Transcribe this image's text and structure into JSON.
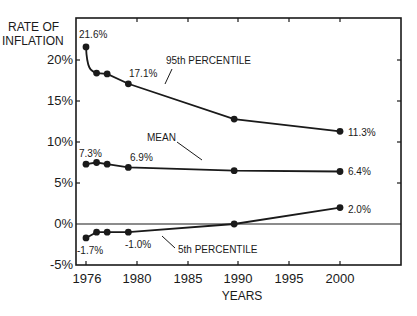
{
  "chart_data": {
    "type": "line",
    "title": "",
    "ylabel": "RATE OF INFLATION",
    "ylabel_lines": [
      "RATE OF",
      "INFLATION"
    ],
    "xlabel": "YEARS",
    "xlim": [
      1975,
      2006
    ],
    "ylim": [
      -5,
      25
    ],
    "x_ticks": [
      1976,
      1980,
      1985,
      1990,
      1995,
      2000
    ],
    "x_tick_labels": [
      "1976",
      "1980",
      "1985",
      "1990",
      "1995",
      "2000"
    ],
    "y_ticks": [
      -5,
      0,
      5,
      10,
      15,
      20
    ],
    "y_tick_labels": [
      "-5%",
      "0%",
      "5%",
      "10%",
      "15%",
      "20%"
    ],
    "grid": false,
    "zero_line": true,
    "series": [
      {
        "name": "95th PERCENTILE",
        "x": [
          1976,
          1977,
          1978,
          1980,
          1990,
          2000
        ],
        "values": [
          21.6,
          18.4,
          18.3,
          17.1,
          12.8,
          11.3
        ]
      },
      {
        "name": "MEAN",
        "x": [
          1976,
          1977,
          1978,
          1980,
          1990,
          2000
        ],
        "values": [
          7.3,
          7.5,
          7.3,
          6.9,
          6.5,
          6.4
        ]
      },
      {
        "name": "5th PERCENTILE",
        "x": [
          1976,
          1977,
          1978,
          1980,
          1990,
          2000
        ],
        "values": [
          -1.7,
          -1.0,
          -1.0,
          -1.0,
          0.0,
          2.0
        ]
      }
    ],
    "annotations": [
      {
        "text": "21.6%",
        "x": 1976,
        "y": 21.6
      },
      {
        "text": "17.1%",
        "x": 1980,
        "y": 17.1
      },
      {
        "text": "11.3%",
        "x": 2000,
        "y": 11.3
      },
      {
        "text": "7.3%",
        "x": 1976,
        "y": 7.3
      },
      {
        "text": "6.9%",
        "x": 1980,
        "y": 6.9
      },
      {
        "text": "6.4%",
        "x": 2000,
        "y": 6.4
      },
      {
        "text": "-1.7%",
        "x": 1976,
        "y": -1.7
      },
      {
        "text": "-1.0%",
        "x": 1980,
        "y": -1.0
      },
      {
        "text": "2.0%",
        "x": 2000,
        "y": 2.0
      }
    ],
    "series_labels": [
      "95th PERCENTILE",
      "MEAN",
      "5th PERCENTILE"
    ]
  }
}
